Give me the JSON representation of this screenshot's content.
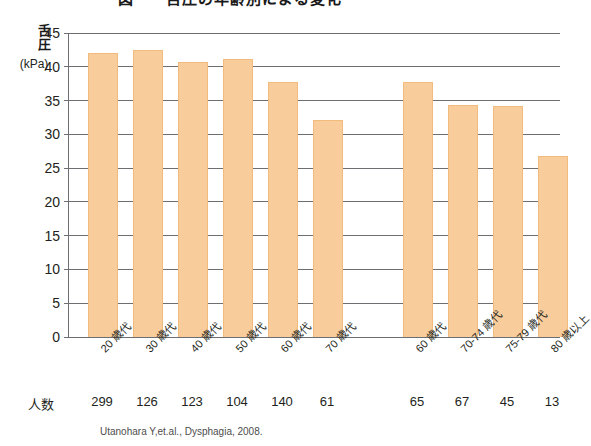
{
  "chart_data": {
    "type": "bar",
    "title": "図　　舌圧の年齢別による変化",
    "ylabel": "舌圧",
    "yunit": "(kPa)",
    "xlabel": "",
    "ylim": [
      0,
      45
    ],
    "yticks": [
      0,
      5,
      10,
      15,
      20,
      25,
      30,
      35,
      40,
      45
    ],
    "grid": true,
    "legend": "none",
    "bar_color": "#f8cd9b",
    "axis_color": "#6d6e71",
    "groups": [
      {
        "name": "group-left",
        "categories": [
          "20 歳代",
          "30 歳代",
          "40 歳代",
          "50 歳代",
          "60 歳代",
          "70 歳代"
        ],
        "values": [
          42.0,
          42.5,
          40.7,
          41.1,
          37.8,
          32.1
        ],
        "counts": [
          299,
          126,
          123,
          104,
          140,
          61
        ]
      },
      {
        "name": "group-right",
        "categories": [
          "60 歳代",
          "70-74 歳代",
          "75-79 歳代",
          "80 歳以上"
        ],
        "values": [
          37.8,
          34.3,
          34.2,
          26.8
        ],
        "counts": [
          65,
          67,
          45,
          13
        ]
      }
    ],
    "counts_row_label": "人数",
    "source": "Utanohara Y,et.al.,  Dysphagia, 2008."
  }
}
